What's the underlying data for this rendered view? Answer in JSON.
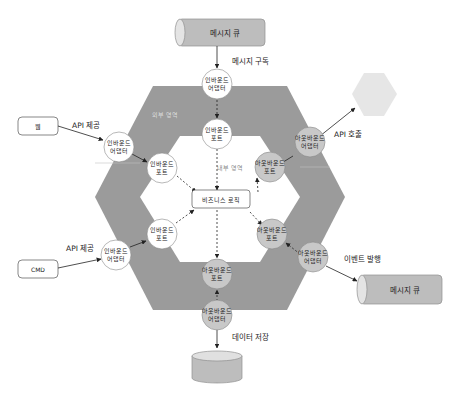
{
  "regions": {
    "outer_label": "외부 영역",
    "inner_label": "내부 영역"
  },
  "core": {
    "business_logic": "비즈니스 로직"
  },
  "external": {
    "web": "웹",
    "cmd": "CMD",
    "queue_top": "메시지 큐",
    "queue_right": "메시지 큐",
    "database": ""
  },
  "edge_labels": {
    "subscribe": "메시지 구독",
    "web_api": "API 제공",
    "cmd_api": "API 제공",
    "api_call": "API 호출",
    "event_publish": "이벤트 발행",
    "data_store": "데이터 저장"
  },
  "nodes": {
    "inbound_adapter_line1": "인바운드",
    "inbound_adapter_line2": "어댑터",
    "inbound_port_line1": "인바운드",
    "inbound_port_line2": "포트",
    "outbound_adapter_line1": "아웃바운드",
    "outbound_adapter_line2": "어댑터",
    "outbound_port_line1": "아웃바운드",
    "outbound_port_line2": "포트"
  },
  "colors": {
    "outer_hex": "#9b9b9b",
    "inner_hex": "#ffffff",
    "inbound_fill": "#ffffff",
    "outbound_fill": "#c8c8c8",
    "cylinder": "#bdbdbd",
    "external_hex": "#e6e6e6"
  }
}
